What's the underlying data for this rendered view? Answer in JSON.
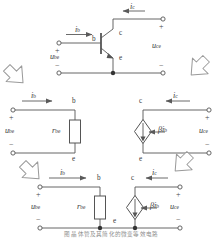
{
  "figure": {
    "caption": "图 晶体管及其简化的微变等效电路",
    "line_color": "#555555",
    "arrow_color": "#9a9a9a",
    "text_color": "#3a3a3a"
  },
  "symbols": {
    "i_b": "i",
    "i_b_sub": "b",
    "i_c": "i",
    "i_c_sub": "c",
    "u_be": "u",
    "u_be_sub": "be",
    "u_ce": "u",
    "u_ce_sub": "ce",
    "r_be": "r",
    "r_be_sub": "be",
    "beta_ib": "βi",
    "beta_ib_sub": "b",
    "node_b": "b",
    "node_c": "c",
    "node_e": "e",
    "plus": "+",
    "minus": "−"
  },
  "stages": [
    {
      "name": "transistor-circuit",
      "description": "NPN transistor with base input and collector output",
      "labels": [
        "i_b",
        "i_c",
        "u_be",
        "u_ce",
        "b",
        "c",
        "e"
      ]
    },
    {
      "name": "input-equivalent-circuit",
      "description": "Input port modeled by resistance r_be between b and e",
      "labels": [
        "i_b",
        "u_be",
        "r_be",
        "b",
        "e"
      ]
    },
    {
      "name": "output-equivalent-circuit",
      "description": "Output port modeled by dependent current source beta*i_b between c and e",
      "labels": [
        "i_c",
        "u_ce",
        "beta_ib",
        "c",
        "e"
      ]
    },
    {
      "name": "combined-equivalent-circuit",
      "description": "Complete small-signal hybrid equivalent circuit, common emitter",
      "labels": [
        "i_b",
        "i_c",
        "u_be",
        "u_ce",
        "r_be",
        "beta_ib",
        "b",
        "c",
        "e"
      ]
    }
  ],
  "flow_arrows": [
    {
      "name": "arrow-top-left",
      "direction": "down-right"
    },
    {
      "name": "arrow-top-right",
      "direction": "down-left"
    },
    {
      "name": "arrow-bottom-left",
      "direction": "down-right"
    },
    {
      "name": "arrow-bottom-right",
      "direction": "down-left"
    }
  ]
}
